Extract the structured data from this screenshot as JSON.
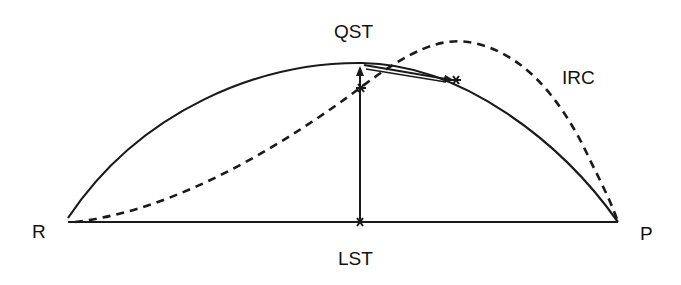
{
  "diagram": {
    "type": "reaction-path",
    "labels": {
      "reactant": "R",
      "product": "P",
      "lst": "LST",
      "qst": "QST",
      "irc": "IRC"
    },
    "colors": {
      "line": "#1a1a1a",
      "background": "#ffffff"
    },
    "curves": [
      {
        "name": "linear-synchronous-transit",
        "style": "solid",
        "from": "R",
        "to": "P"
      },
      {
        "name": "quadratic-synchronous-transit",
        "style": "solid-arc",
        "from": "R",
        "via": "QST",
        "to": "P"
      },
      {
        "name": "intrinsic-reaction-coordinate",
        "style": "dashed",
        "from": "R",
        "to": "P"
      }
    ],
    "arrows": [
      {
        "name": "lst-to-qst",
        "from": "LST",
        "to": "QST"
      },
      {
        "name": "qst-to-ts",
        "from": "QST",
        "to": "transition-state"
      }
    ]
  }
}
